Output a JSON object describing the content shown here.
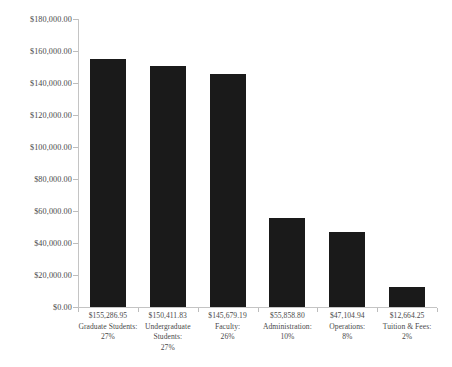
{
  "chart_data": {
    "type": "bar",
    "title": "",
    "subtitle": "",
    "xlabel": "",
    "ylabel": "",
    "ylim": [
      0,
      180000
    ],
    "ytick_step": 20000,
    "grid": false,
    "legend": false,
    "bar_color": "#1a1a1a",
    "axis_color": "#c4c4c4",
    "categories": [
      "Graduate Students:",
      "Undergraduate Students:",
      "Faculty:",
      "Administration:",
      "Operations:",
      "Tuition & Fees:"
    ],
    "values": [
      155286.95,
      150411.83,
      145679.19,
      55858.8,
      47104.94,
      12664.25
    ],
    "value_labels": [
      "$155,286.95",
      "$150,411.83",
      "$145,679.19",
      "$55,858.80",
      "$47,104.94",
      "$12,664.25"
    ],
    "percent_labels": [
      "27%",
      "27%",
      "26%",
      "10%",
      "8%",
      "2%"
    ],
    "ytick_labels": [
      "$180,000.00",
      "$160,000.00",
      "$140,000.00",
      "$120,000.00",
      "$100,000.00",
      "$80,000.00",
      "$60,000.00",
      "$40,000.00",
      "$20,000.00",
      "$0.00"
    ],
    "ytick_values": [
      180000,
      160000,
      140000,
      120000,
      100000,
      80000,
      60000,
      40000,
      20000,
      0
    ]
  }
}
